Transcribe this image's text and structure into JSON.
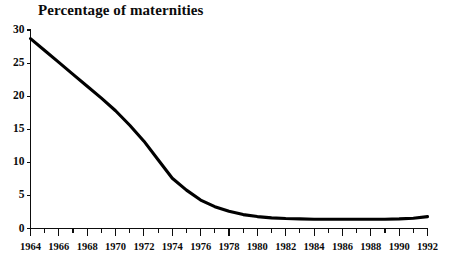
{
  "chart_data": {
    "type": "line",
    "title": "Percentage of maternities",
    "xlabel": "",
    "ylabel": "",
    "xlim": [
      1964,
      1992
    ],
    "ylim": [
      0,
      30
    ],
    "yticks": [
      0,
      5,
      10,
      15,
      20,
      25,
      30
    ],
    "ytick_labels": [
      "0",
      "5",
      "10",
      "15",
      "20",
      "25",
      "30"
    ],
    "xticks": [
      1964,
      1965,
      1966,
      1967,
      1968,
      1969,
      1970,
      1971,
      1972,
      1973,
      1974,
      1975,
      1976,
      1977,
      1978,
      1979,
      1980,
      1981,
      1982,
      1983,
      1984,
      1985,
      1986,
      1987,
      1988,
      1989,
      1990,
      1991,
      1992
    ],
    "xtick_labels": [
      "1964",
      "1966",
      "1968",
      "1970",
      "1972",
      "1974",
      "1976",
      "1978",
      "1980",
      "1982",
      "1984",
      "1986",
      "1988",
      "1990",
      "1992"
    ],
    "xtick_label_values": [
      1964,
      1966,
      1968,
      1970,
      1972,
      1974,
      1976,
      1978,
      1980,
      1982,
      1984,
      1986,
      1988,
      1990,
      1992
    ],
    "grid": false,
    "legend": false,
    "line_color": "#000000",
    "series": [
      {
        "name": "Percentage of maternities",
        "x": [
          1964,
          1965,
          1966,
          1967,
          1968,
          1969,
          1970,
          1971,
          1972,
          1973,
          1974,
          1975,
          1976,
          1977,
          1978,
          1979,
          1980,
          1981,
          1982,
          1983,
          1984,
          1985,
          1986,
          1987,
          1988,
          1989,
          1990,
          1991,
          1992
        ],
        "values": [
          28.7,
          26.9,
          25.1,
          23.3,
          21.5,
          19.7,
          17.8,
          15.6,
          13.2,
          10.4,
          7.6,
          5.8,
          4.3,
          3.3,
          2.6,
          2.1,
          1.8,
          1.6,
          1.5,
          1.45,
          1.4,
          1.4,
          1.4,
          1.4,
          1.4,
          1.4,
          1.45,
          1.55,
          1.8
        ]
      }
    ]
  },
  "footnote": {
    "text": ""
  }
}
